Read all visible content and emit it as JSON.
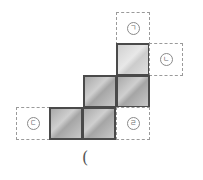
{
  "figure": {
    "labels": {
      "a": "ㄱ",
      "b": "ㄴ",
      "c": "ㄷ",
      "d": "ㄹ"
    },
    "answer_prompt": "("
  },
  "colors": {
    "filled_square": "#b8b8b8",
    "filled_border": "#4a4a4a",
    "dashed_border": "#9a9a9a"
  }
}
